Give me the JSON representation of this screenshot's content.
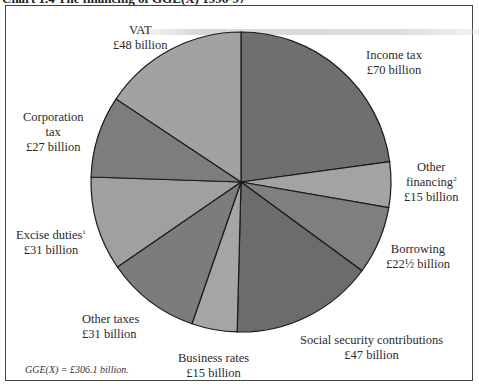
{
  "chart_data": {
    "type": "pie",
    "title": "Chart 1.4 The financing of GGE(X) 1996-97",
    "start_angle": "top (12 o'clock), clockwise",
    "total_note": "GGE(X) = £306.1 billion.",
    "unit": "£ billion",
    "slices": [
      {
        "label": "Income tax",
        "value": 70,
        "display": "£70 billion",
        "color": "#6f6f6f"
      },
      {
        "label": "Other financing",
        "footnote": "2",
        "value": 15,
        "display": "£15 billion",
        "color": "#a3a3a3"
      },
      {
        "label": "Borrowing",
        "value": 22.5,
        "display": "£22½ billion",
        "color": "#7f7f7f"
      },
      {
        "label": "Social security contributions",
        "value": 47,
        "display": "£47 billion",
        "color": "#6c6c6c"
      },
      {
        "label": "Business rates",
        "value": 15,
        "display": "£15 billion",
        "color": "#a5a5a5"
      },
      {
        "label": "Other taxes",
        "value": 31,
        "display": "£31 billion",
        "color": "#7c7c7c"
      },
      {
        "label": "Excise duties",
        "footnote": "1",
        "value": 31,
        "display": "£31 billion",
        "color": "#a0a0a0"
      },
      {
        "label": "Corporation tax",
        "value": 27,
        "display": "£27 billion",
        "color": "#7d7d7d"
      },
      {
        "label": "VAT",
        "value": 48,
        "display": "£48 billion",
        "color": "#a2a2a2"
      }
    ]
  },
  "labels": {
    "title": "Chart 1.4 The financing of GGE(X) 1996-97",
    "vat": {
      "name": "VAT",
      "amount": "£48 billion"
    },
    "income_tax": {
      "name": "Income tax",
      "amount": "£70 billion"
    },
    "other_financing": {
      "name": "Other",
      "name2": "financing",
      "sup": "2",
      "amount": "£15 billion"
    },
    "borrowing": {
      "name": "Borrowing",
      "amount": "£22½ billion"
    },
    "social_security": {
      "name": "Social security contributions",
      "amount": "£47 billion"
    },
    "business_rates": {
      "name": "Business rates",
      "amount": "£15 billion"
    },
    "other_taxes": {
      "name": "Other taxes",
      "amount": "£31 billion"
    },
    "excise": {
      "name": "Excise duties",
      "sup": "1",
      "amount": "£31 billion"
    },
    "corporation": {
      "name": "Corporation",
      "name2": "tax",
      "amount": "£27 billion"
    },
    "note": "GGE(X) = £306.1 billion."
  }
}
